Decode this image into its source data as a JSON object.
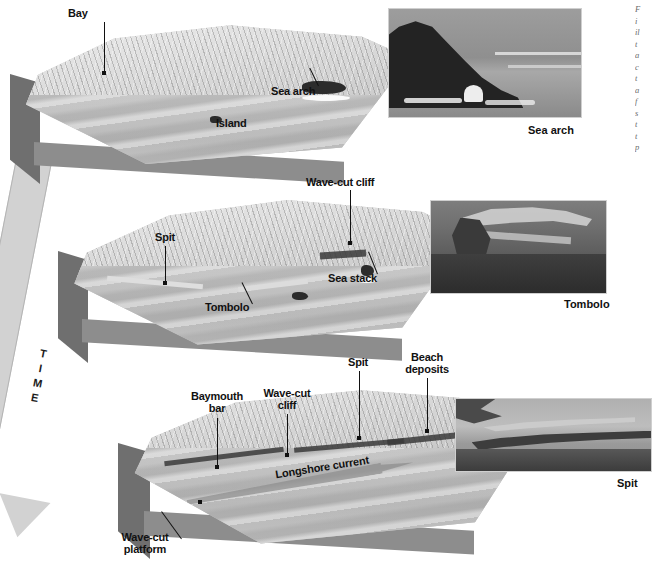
{
  "figure": {
    "time_axis_label": "TIME",
    "time_letters": [
      "T",
      "I",
      "M",
      "E"
    ]
  },
  "stages": [
    {
      "name": "stage-1-youthful-coast",
      "labels": [
        {
          "text": "Bay",
          "name": "label-bay"
        },
        {
          "text": "Sea arch",
          "name": "label-sea-arch"
        },
        {
          "text": "Island",
          "name": "label-island"
        }
      ]
    },
    {
      "name": "stage-2-maturing-coast",
      "labels": [
        {
          "text": "Wave-cut cliff",
          "name": "label-wave-cut-cliff"
        },
        {
          "text": "Spit",
          "name": "label-spit"
        },
        {
          "text": "Sea stack",
          "name": "label-sea-stack"
        },
        {
          "text": "Tombolo",
          "name": "label-tombolo"
        }
      ]
    },
    {
      "name": "stage-3-straightened-coast",
      "labels": [
        {
          "text": "Baymouth bar",
          "name": "label-baymouth-bar"
        },
        {
          "text": "Wave-cut cliff",
          "name": "label-wave-cut-cliff-2"
        },
        {
          "text": "Spit",
          "name": "label-spit-2"
        },
        {
          "text": "Beach deposits",
          "name": "label-beach-deposits"
        },
        {
          "text": "Longshore current",
          "name": "label-longshore-current"
        },
        {
          "text": "Wave-cut platform",
          "name": "label-wave-cut-platform"
        }
      ]
    }
  ],
  "photos": [
    {
      "name": "photo-sea-arch",
      "caption": "Sea arch"
    },
    {
      "name": "photo-tombolo",
      "caption": "Tombolo"
    },
    {
      "name": "photo-spit",
      "caption": "Spit"
    }
  ],
  "caption_column": {
    "note": "caption clipped at right image edge; only leading glyphs visible",
    "lines": [
      "F",
      "i",
      "il",
      "t",
      "a",
      "c",
      "t",
      "a",
      "f",
      "s",
      "t",
      "t",
      "p"
    ]
  },
  "colors": {
    "page_background": "#ffffff",
    "slab_side": "#6f6f6f",
    "slab_front": "#8d8d8d",
    "land_light": "#d8d8d8",
    "sea_gray": "#b9b9b9",
    "rock_dark": "#2c2c2c",
    "time_arrow": "#d2d2d2",
    "label_text": "#111111"
  }
}
